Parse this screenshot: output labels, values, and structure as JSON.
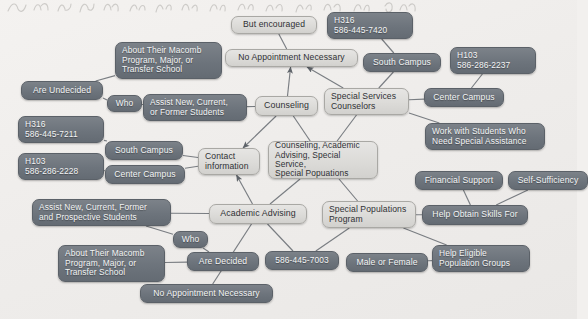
{
  "diagram": {
    "type": "concept-map",
    "title_text_visible": false,
    "colors": {
      "dark_node_fill": "#6d747c",
      "dark_node_text": "#f3f4f5",
      "light_node_fill": "#dcdbd8",
      "light_node_text": "#2f3135",
      "edge_line": "#7a7e83",
      "background": "#efedeb"
    },
    "nodes": [
      {
        "id": "n_but_encouraged",
        "label": "But encouraged",
        "style": "light",
        "x": 231,
        "y": 16,
        "w": 86,
        "h": 18,
        "fs": 8.6,
        "align": "center"
      },
      {
        "id": "n_h316_7420",
        "label": "H316\n586-445-7420",
        "style": "dark",
        "x": 327,
        "y": 12,
        "w": 86,
        "h": 27,
        "fs": 8.4,
        "align": "left"
      },
      {
        "id": "n_no_appt_top",
        "label": "No Appointment Necessary",
        "style": "light",
        "x": 225,
        "y": 49,
        "w": 133,
        "h": 18,
        "fs": 8.6,
        "align": "center"
      },
      {
        "id": "n_south_campus_top",
        "label": "South Campus",
        "style": "dark",
        "x": 363,
        "y": 53,
        "w": 78,
        "h": 19,
        "fs": 8.6,
        "align": "center"
      },
      {
        "id": "n_h103_2237",
        "label": "H103\n586-286-2237",
        "style": "dark",
        "x": 450,
        "y": 47,
        "w": 86,
        "h": 27,
        "fs": 8.4,
        "align": "left"
      },
      {
        "id": "n_about_macomb_top",
        "label": "About Their Macomb\nProgram, Major, or\nTransfer School",
        "style": "dark",
        "x": 115,
        "y": 42,
        "w": 107,
        "h": 37,
        "fs": 8.4,
        "align": "left"
      },
      {
        "id": "n_are_undecided",
        "label": "Are Undecided",
        "style": "dark",
        "x": 21,
        "y": 81,
        "w": 82,
        "h": 19,
        "fs": 8.6,
        "align": "center"
      },
      {
        "id": "n_who_top",
        "label": "Who",
        "style": "dark",
        "x": 107,
        "y": 95,
        "w": 35,
        "h": 17,
        "fs": 8.4,
        "align": "center"
      },
      {
        "id": "n_assist_new_current",
        "label": "Assist New, Current,\nor Former Students",
        "style": "dark",
        "x": 143,
        "y": 94,
        "w": 104,
        "h": 27,
        "fs": 8.4,
        "align": "left"
      },
      {
        "id": "n_counseling",
        "label": "Counseling",
        "style": "light",
        "x": 255,
        "y": 96,
        "w": 63,
        "h": 20,
        "fs": 8.8,
        "align": "center"
      },
      {
        "id": "n_special_services",
        "label": "Special Services\nCounselors",
        "style": "light",
        "x": 324,
        "y": 88,
        "w": 85,
        "h": 27,
        "fs": 8.6,
        "align": "left"
      },
      {
        "id": "n_center_campus_top",
        "label": "Center Campus",
        "style": "dark",
        "x": 424,
        "y": 88,
        "w": 80,
        "h": 19,
        "fs": 8.6,
        "align": "center"
      },
      {
        "id": "n_work_with_students",
        "label": "Work with Students Who\nNeed Special Assistance",
        "style": "dark",
        "x": 425,
        "y": 123,
        "w": 120,
        "h": 27,
        "fs": 8.4,
        "align": "left"
      },
      {
        "id": "n_h316_7211",
        "label": "H316\n586-445-7211",
        "style": "dark",
        "x": 18,
        "y": 116,
        "w": 86,
        "h": 27,
        "fs": 8.4,
        "align": "left"
      },
      {
        "id": "n_south_campus_left",
        "label": "South Campus",
        "style": "dark",
        "x": 105,
        "y": 141,
        "w": 78,
        "h": 19,
        "fs": 8.6,
        "align": "center"
      },
      {
        "id": "n_h103_2228",
        "label": "H103\n586-286-2228",
        "style": "dark",
        "x": 18,
        "y": 153,
        "w": 86,
        "h": 27,
        "fs": 8.4,
        "align": "left"
      },
      {
        "id": "n_center_campus_left",
        "label": "Center Campus",
        "style": "dark",
        "x": 105,
        "y": 165,
        "w": 80,
        "h": 19,
        "fs": 8.6,
        "align": "center"
      },
      {
        "id": "n_contact_information",
        "label": "Contact\ninformation",
        "style": "light",
        "x": 198,
        "y": 148,
        "w": 62,
        "h": 27,
        "fs": 8.6,
        "align": "left"
      },
      {
        "id": "n_center_main",
        "label": "Counseling, Academic\nAdvising, Special Service,\nSpecial Popuations",
        "style": "light",
        "x": 268,
        "y": 141,
        "w": 110,
        "h": 38,
        "fs": 8.4,
        "align": "left"
      },
      {
        "id": "n_financial_support",
        "label": "Financial Support",
        "style": "dark",
        "x": 415,
        "y": 171,
        "w": 88,
        "h": 19,
        "fs": 8.6,
        "align": "center"
      },
      {
        "id": "n_self_sufficiency",
        "label": "Self-Sufficiency",
        "style": "dark",
        "x": 508,
        "y": 171,
        "w": 80,
        "h": 19,
        "fs": 8.6,
        "align": "center"
      },
      {
        "id": "n_assist_prospective",
        "label": "Assist New, Current, Former\nand Prospective Students",
        "style": "dark",
        "x": 32,
        "y": 199,
        "w": 139,
        "h": 27,
        "fs": 8.4,
        "align": "left"
      },
      {
        "id": "n_academic_advising",
        "label": "Academic Advising",
        "style": "light",
        "x": 209,
        "y": 204,
        "w": 98,
        "h": 20,
        "fs": 8.8,
        "align": "center"
      },
      {
        "id": "n_special_pop_program",
        "label": "Special Populations\nProgram",
        "style": "light",
        "x": 322,
        "y": 201,
        "w": 94,
        "h": 27,
        "fs": 8.6,
        "align": "left"
      },
      {
        "id": "n_help_obtain_skills",
        "label": "Help Obtain Skills For",
        "style": "dark",
        "x": 422,
        "y": 205,
        "w": 106,
        "h": 20,
        "fs": 8.6,
        "align": "center"
      },
      {
        "id": "n_who_bottom",
        "label": "Who",
        "style": "dark",
        "x": 173,
        "y": 231,
        "w": 35,
        "h": 17,
        "fs": 8.4,
        "align": "center"
      },
      {
        "id": "n_about_macomb_bottom",
        "label": "About Their Macomb\nProgram, Major, or\nTransfer School",
        "style": "dark",
        "x": 58,
        "y": 245,
        "w": 107,
        "h": 37,
        "fs": 8.4,
        "align": "left"
      },
      {
        "id": "n_are_decided",
        "label": "Are Decided",
        "style": "dark",
        "x": 187,
        "y": 252,
        "w": 72,
        "h": 19,
        "fs": 8.6,
        "align": "center"
      },
      {
        "id": "n_phone_7003",
        "label": "586-445-7003",
        "style": "dark",
        "x": 265,
        "y": 251,
        "w": 74,
        "h": 19,
        "fs": 8.4,
        "align": "center"
      },
      {
        "id": "n_male_or_female",
        "label": "Male or Female",
        "style": "dark",
        "x": 346,
        "y": 253,
        "w": 82,
        "h": 19,
        "fs": 8.6,
        "align": "center"
      },
      {
        "id": "n_help_eligible",
        "label": "Help Eligible\nPopulation Groups",
        "style": "dark",
        "x": 432,
        "y": 245,
        "w": 98,
        "h": 27,
        "fs": 8.4,
        "align": "left"
      },
      {
        "id": "n_no_appt_bottom",
        "label": "No Appointment Necessary",
        "style": "dark",
        "x": 140,
        "y": 284,
        "w": 133,
        "h": 19,
        "fs": 8.6,
        "align": "center"
      }
    ],
    "edges": [
      {
        "from": "n_but_encouraged",
        "to": "n_no_appt_top",
        "arrow": false
      },
      {
        "from": "n_h316_7420",
        "to": "n_south_campus_top",
        "arrow": false
      },
      {
        "from": "n_counseling",
        "to": "n_no_appt_top",
        "arrow": true
      },
      {
        "from": "n_about_macomb_top",
        "to": "n_are_undecided",
        "arrow": false
      },
      {
        "from": "n_are_undecided",
        "to": "n_who_top",
        "arrow": false
      },
      {
        "from": "n_who_top",
        "to": "n_assist_new_current",
        "arrow": false
      },
      {
        "from": "n_assist_new_current",
        "to": "n_counseling",
        "arrow": false
      },
      {
        "from": "n_counseling",
        "to": "n_contact_information",
        "arrow": true
      },
      {
        "from": "n_counseling",
        "to": "n_center_main",
        "arrow": false
      },
      {
        "from": "n_south_campus_top",
        "to": "n_special_services",
        "arrow": false
      },
      {
        "from": "n_h103_2237",
        "to": "n_center_campus_top",
        "arrow": false
      },
      {
        "from": "n_center_campus_top",
        "to": "n_special_services",
        "arrow": false
      },
      {
        "from": "n_special_services",
        "to": "n_no_appt_top",
        "arrow": true
      },
      {
        "from": "n_special_services",
        "to": "n_work_with_students",
        "arrow": false
      },
      {
        "from": "n_special_services",
        "to": "n_center_main",
        "arrow": false
      },
      {
        "from": "n_h316_7211",
        "to": "n_south_campus_left",
        "arrow": false
      },
      {
        "from": "n_south_campus_left",
        "to": "n_contact_information",
        "arrow": false
      },
      {
        "from": "n_h103_2228",
        "to": "n_center_campus_left",
        "arrow": false
      },
      {
        "from": "n_center_campus_left",
        "to": "n_contact_information",
        "arrow": false
      },
      {
        "from": "n_academic_advising",
        "to": "n_contact_information",
        "arrow": true
      },
      {
        "from": "n_center_main",
        "to": "n_academic_advising",
        "arrow": false
      },
      {
        "from": "n_center_main",
        "to": "n_special_pop_program",
        "arrow": false
      },
      {
        "from": "n_assist_prospective",
        "to": "n_academic_advising",
        "arrow": false
      },
      {
        "from": "n_assist_prospective",
        "to": "n_who_bottom",
        "arrow": false
      },
      {
        "from": "n_who_bottom",
        "to": "n_are_decided",
        "arrow": false
      },
      {
        "from": "n_about_macomb_bottom",
        "to": "n_are_decided",
        "arrow": false
      },
      {
        "from": "n_academic_advising",
        "to": "n_phone_7003",
        "arrow": false
      },
      {
        "from": "n_academic_advising",
        "to": "n_no_appt_bottom",
        "arrow": false
      },
      {
        "from": "n_special_pop_program",
        "to": "n_help_obtain_skills",
        "arrow": false
      },
      {
        "from": "n_special_pop_program",
        "to": "n_phone_7003",
        "arrow": false
      },
      {
        "from": "n_special_pop_program",
        "to": "n_help_eligible",
        "arrow": false
      },
      {
        "from": "n_financial_support",
        "to": "n_help_obtain_skills",
        "arrow": false
      },
      {
        "from": "n_self_sufficiency",
        "to": "n_help_obtain_skills",
        "arrow": false
      },
      {
        "from": "n_male_or_female",
        "to": "n_help_eligible",
        "arrow": false
      }
    ]
  }
}
